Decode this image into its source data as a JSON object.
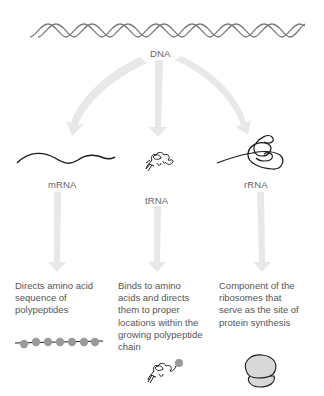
{
  "diagram": {
    "source": {
      "label": "DNA"
    },
    "products": [
      {
        "label": "mRNA",
        "description": [
          "Directs amino acid",
          "sequence of",
          "polypeptides"
        ],
        "result_icon": "polypeptide-chain-icon"
      },
      {
        "label": "tRNA",
        "description": [
          "Binds to amino",
          "acids and directs",
          "them to proper",
          "locations within the",
          "growing polypeptide",
          "chain"
        ],
        "result_icon": "trna-with-amino-acid-icon"
      },
      {
        "label": "rRNA",
        "description": [
          "Component of the",
          "ribosomes that",
          "serve as the site of",
          "protein synthesis"
        ],
        "result_icon": "ribosome-icon"
      }
    ],
    "colors": {
      "arrow": "#e6e6e6",
      "strand": "#222222",
      "helix": "#777777",
      "bead": "#9a9a9a",
      "ribosome": "#d8d8d8"
    }
  }
}
